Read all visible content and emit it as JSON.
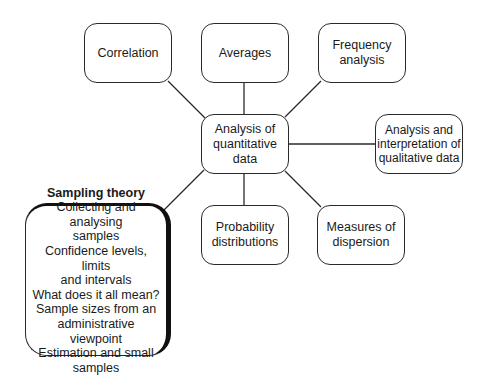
{
  "diagram": {
    "center": {
      "lines": [
        "Analysis of",
        "quantitative",
        "data"
      ]
    },
    "nodes": [
      {
        "id": "correlation",
        "lines": [
          "Correlation"
        ]
      },
      {
        "id": "averages",
        "lines": [
          "Averages"
        ]
      },
      {
        "id": "frequency",
        "lines": [
          "Frequency",
          "analysis"
        ]
      },
      {
        "id": "qualitative",
        "lines": [
          "Analysis and",
          "interpretation of",
          "qualitative data"
        ]
      },
      {
        "id": "probability",
        "lines": [
          "Probability",
          "distributions"
        ]
      },
      {
        "id": "dispersion",
        "lines": [
          "Measures of",
          "dispersion"
        ]
      }
    ],
    "highlight": {
      "title": "Sampling theory",
      "lines": [
        "Collecting and analysing",
        "samples",
        "Confidence levels, limits",
        "and intervals",
        "What does it all mean?",
        "Sample sizes from an",
        "administrative viewpoint",
        "Estimation and small",
        "samples"
      ]
    }
  }
}
